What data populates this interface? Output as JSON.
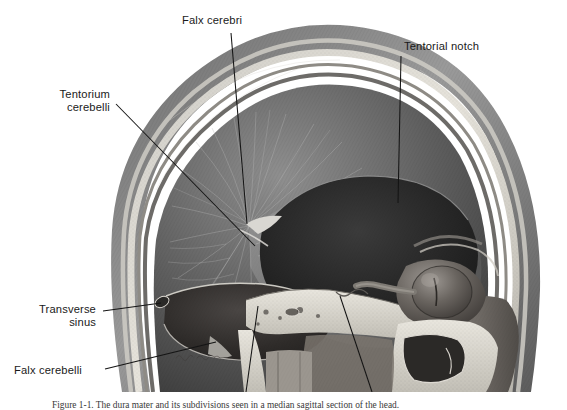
{
  "figure": {
    "background_color": "#ffffff",
    "ink_color": "#1a1a1a",
    "labels": [
      {
        "id": "falx-cerebri",
        "text": "Falx cerebri",
        "align": "left"
      },
      {
        "id": "tentorial-notch",
        "text": "Tentorial notch",
        "align": "left"
      },
      {
        "id": "tentorium-cerebelli",
        "text": "Tentorium\ncerebelli",
        "align": "right"
      },
      {
        "id": "transverse-sinus",
        "text": "Transverse\nsinus",
        "align": "right"
      },
      {
        "id": "falx-cerebelli",
        "text": "Falx cerebelli",
        "align": "left"
      }
    ],
    "caption": "Figure 1-1.  The dura mater and its subdivisions seen in a median sagittal section of the head."
  }
}
